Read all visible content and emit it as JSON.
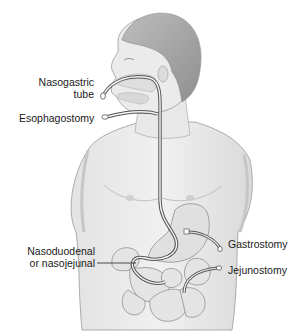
{
  "diagram": {
    "labels": {
      "nasogastric_line1": "Nasogastric",
      "nasogastric_line2": "tube",
      "esophagostomy": "Esophagostomy",
      "nasoduodenal_line1": "Nasoduodenal",
      "nasoduodenal_line2": "or nasojejunal",
      "gastrostomy": "Gastrostomy",
      "jejunostomy": "Jejunostomy"
    },
    "colors": {
      "background": "#ffffff",
      "skin_fill": "#ececec",
      "skin_shadow": "#d4d4d4",
      "outline": "#8a8a8a",
      "hair": "#a8a8a8",
      "organ_fill": "#e2e2e2",
      "tube": "#555555",
      "text": "#1a1a1a"
    }
  }
}
